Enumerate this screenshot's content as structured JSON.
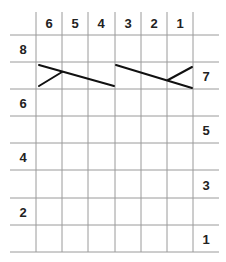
{
  "chart": {
    "type": "knitting-chart",
    "column_labels": [
      "6",
      "5",
      "4",
      "3",
      "2",
      "1"
    ],
    "left_row_labels": [
      "8",
      "6",
      "4",
      "2"
    ],
    "right_row_labels": [
      "7",
      "5",
      "3",
      "1"
    ],
    "grid_color": "#9a9a9a",
    "stroke_color": "#111111",
    "symbols": [
      {
        "name": "left-cross",
        "row": 7,
        "columns": "6-4"
      },
      {
        "name": "right-cross",
        "row": 7,
        "columns": "3-1"
      }
    ]
  }
}
